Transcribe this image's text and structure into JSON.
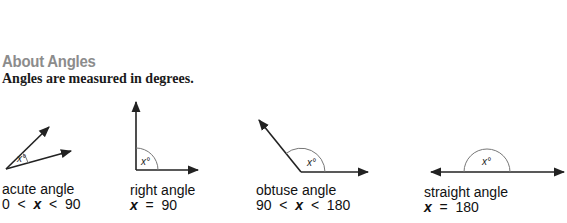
{
  "header": {
    "title": "About Angles",
    "subtitle": "Angles are measured in degrees."
  },
  "angles": [
    {
      "name": "acute angle",
      "condition": "0  <  x  <  90",
      "cond_parts": [
        "0  <  ",
        "x",
        "  <  90"
      ],
      "marker": "x°"
    },
    {
      "name": "right angle",
      "condition": "x  =  90",
      "cond_parts": [
        "",
        "x",
        "  =  90"
      ],
      "marker": "x°"
    },
    {
      "name": "obtuse angle",
      "condition": "90  <  x  <  180",
      "cond_parts": [
        "90  <  ",
        "x",
        "  <  180"
      ],
      "marker": "x°"
    },
    {
      "name": "straight angle",
      "condition": "x  =  180",
      "cond_parts": [
        "",
        "x",
        "  =  180"
      ],
      "marker": "x°"
    }
  ],
  "colors": {
    "title": "#8c8c8c",
    "line": "#222222",
    "arc": "#777777"
  }
}
